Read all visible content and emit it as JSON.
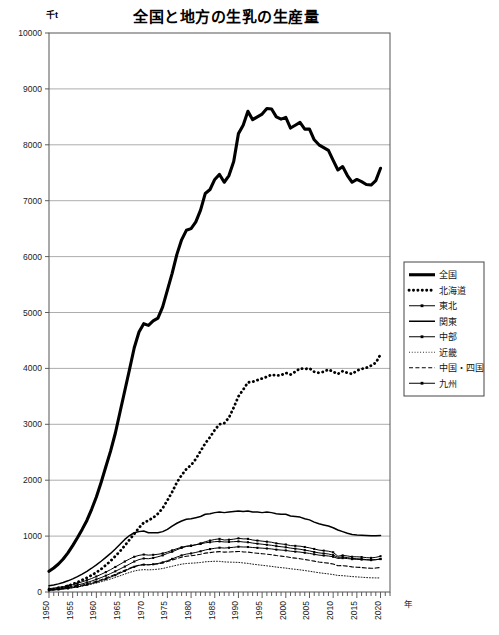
{
  "chart_data": {
    "type": "line",
    "title": "全国と地方の生乳の生産量",
    "unit_label": "千t",
    "xlabel": "年",
    "ylabel": "",
    "xlim": [
      1950,
      2022
    ],
    "ylim": [
      0,
      10000
    ],
    "ytick_step": 1000,
    "yticks": [
      "0",
      "1000",
      "2000",
      "3000",
      "4000",
      "5000",
      "6000",
      "7000",
      "8000",
      "9000",
      "10000"
    ],
    "xticks": [
      "1950",
      "1955",
      "1960",
      "1965",
      "1970",
      "1975",
      "1980",
      "1985",
      "1990",
      "1995",
      "2000",
      "2005",
      "2010",
      "2015",
      "2020"
    ],
    "xtick_step": 5,
    "xminor_step": 1,
    "grid": "horizontal",
    "legend_position": "right-middle",
    "x": [
      1950,
      1951,
      1952,
      1953,
      1954,
      1955,
      1956,
      1957,
      1958,
      1959,
      1960,
      1961,
      1962,
      1963,
      1964,
      1965,
      1966,
      1967,
      1968,
      1969,
      1970,
      1971,
      1972,
      1973,
      1974,
      1975,
      1976,
      1977,
      1978,
      1979,
      1980,
      1981,
      1982,
      1983,
      1984,
      1985,
      1986,
      1987,
      1988,
      1989,
      1990,
      1991,
      1992,
      1993,
      1994,
      1995,
      1996,
      1997,
      1998,
      1999,
      2000,
      2001,
      2002,
      2003,
      2004,
      2005,
      2006,
      2007,
      2008,
      2009,
      2010,
      2011,
      2012,
      2013,
      2014,
      2015,
      2016,
      2017,
      2018,
      2019,
      2020
    ],
    "series": [
      {
        "name": "全国",
        "style": "thick-solid",
        "values": [
          370,
          430,
          500,
          590,
          700,
          830,
          970,
          1120,
          1280,
          1480,
          1700,
          1960,
          2240,
          2520,
          2840,
          3220,
          3600,
          3980,
          4370,
          4650,
          4800,
          4770,
          4850,
          4900,
          5100,
          5400,
          5700,
          6040,
          6300,
          6470,
          6500,
          6620,
          6830,
          7130,
          7200,
          7380,
          7470,
          7330,
          7450,
          7700,
          8200,
          8350,
          8600,
          8450,
          8500,
          8550,
          8650,
          8640,
          8500,
          8460,
          8490,
          8300,
          8350,
          8400,
          8280,
          8280,
          8090,
          8000,
          7950,
          7900,
          7720,
          7550,
          7610,
          7450,
          7330,
          7380,
          7340,
          7290,
          7280,
          7360,
          7580
        ]
      },
      {
        "name": "北海道",
        "style": "thick-dotted",
        "values": [
          40,
          50,
          65,
          85,
          110,
          140,
          175,
          215,
          255,
          300,
          350,
          410,
          480,
          555,
          640,
          730,
          830,
          935,
          1040,
          1150,
          1240,
          1280,
          1330,
          1400,
          1500,
          1640,
          1790,
          1960,
          2090,
          2200,
          2270,
          2380,
          2520,
          2660,
          2770,
          2900,
          3000,
          3020,
          3120,
          3300,
          3500,
          3620,
          3750,
          3760,
          3790,
          3820,
          3850,
          3890,
          3870,
          3880,
          3920,
          3890,
          3940,
          4000,
          3990,
          4000,
          3940,
          3920,
          3940,
          3980,
          3940,
          3900,
          3950,
          3920,
          3900,
          3960,
          3990,
          4010,
          4050,
          4100,
          4250
        ]
      },
      {
        "name": "東北",
        "style": "marker-line",
        "values": [
          45,
          52,
          62,
          74,
          88,
          104,
          124,
          146,
          170,
          196,
          226,
          258,
          292,
          330,
          370,
          412,
          455,
          500,
          545,
          580,
          600,
          595,
          610,
          630,
          655,
          690,
          720,
          755,
          790,
          815,
          825,
          845,
          870,
          900,
          920,
          940,
          950,
          930,
          935,
          945,
          960,
          950,
          950,
          930,
          920,
          910,
          900,
          890,
          870,
          860,
          850,
          830,
          825,
          820,
          805,
          790,
          770,
          750,
          740,
          730,
          710,
          640,
          655,
          645,
          630,
          630,
          625,
          615,
          610,
          620,
          640
        ]
      },
      {
        "name": "関東",
        "style": "solid",
        "values": [
          110,
          125,
          145,
          170,
          200,
          235,
          275,
          320,
          370,
          425,
          485,
          550,
          620,
          690,
          770,
          855,
          940,
          1010,
          1060,
          1080,
          1090,
          1060,
          1060,
          1060,
          1080,
          1120,
          1180,
          1230,
          1270,
          1300,
          1310,
          1330,
          1350,
          1390,
          1400,
          1420,
          1430,
          1420,
          1430,
          1440,
          1450,
          1440,
          1450,
          1430,
          1430,
          1420,
          1430,
          1420,
          1400,
          1390,
          1390,
          1360,
          1350,
          1340,
          1310,
          1290,
          1250,
          1220,
          1200,
          1180,
          1150,
          1110,
          1080,
          1050,
          1030,
          1020,
          1015,
          1010,
          1005,
          1005,
          1010
        ]
      },
      {
        "name": "中部",
        "style": "marker-line",
        "values": [
          60,
          70,
          82,
          96,
          113,
          133,
          156,
          182,
          210,
          242,
          278,
          316,
          356,
          400,
          448,
          496,
          545,
          590,
          630,
          655,
          670,
          660,
          665,
          675,
          690,
          715,
          745,
          775,
          800,
          820,
          830,
          845,
          860,
          880,
          890,
          900,
          905,
          895,
          895,
          900,
          905,
          895,
          890,
          875,
          865,
          855,
          845,
          835,
          820,
          810,
          800,
          785,
          775,
          765,
          750,
          735,
          715,
          700,
          690,
          680,
          660,
          620,
          625,
          615,
          600,
          595,
          590,
          580,
          575,
          580,
          590
        ]
      },
      {
        "name": "近畿",
        "style": "fine-dotted",
        "values": [
          35,
          40,
          47,
          55,
          65,
          77,
          90,
          105,
          122,
          140,
          161,
          183,
          207,
          233,
          260,
          290,
          320,
          350,
          375,
          392,
          400,
          396,
          400,
          408,
          420,
          440,
          460,
          480,
          498,
          510,
          515,
          520,
          528,
          540,
          545,
          550,
          548,
          538,
          535,
          532,
          530,
          520,
          512,
          498,
          488,
          478,
          468,
          458,
          446,
          436,
          428,
          415,
          406,
          396,
          384,
          372,
          358,
          344,
          334,
          324,
          312,
          296,
          292,
          284,
          276,
          270,
          264,
          258,
          254,
          252,
          252
        ]
      },
      {
        "name": "中国・四国",
        "style": "dashed",
        "values": [
          38,
          45,
          54,
          64,
          76,
          90,
          107,
          125,
          146,
          168,
          194,
          221,
          250,
          282,
          316,
          352,
          388,
          424,
          458,
          480,
          492,
          487,
          494,
          504,
          520,
          545,
          572,
          598,
          622,
          640,
          648,
          660,
          675,
          695,
          705,
          716,
          722,
          714,
          716,
          720,
          725,
          718,
          714,
          702,
          694,
          685,
          676,
          666,
          652,
          642,
          632,
          616,
          606,
          596,
          582,
          568,
          552,
          536,
          526,
          516,
          500,
          470,
          472,
          462,
          450,
          444,
          438,
          430,
          425,
          428,
          440
        ]
      },
      {
        "name": "九州",
        "style": "marker-line",
        "values": [
          30,
          36,
          44,
          53,
          64,
          77,
          92,
          110,
          130,
          152,
          178,
          205,
          234,
          266,
          300,
          338,
          376,
          414,
          450,
          476,
          490,
          486,
          496,
          510,
          530,
          560,
          592,
          625,
          655,
          678,
          690,
          708,
          728,
          752,
          768,
          782,
          792,
          786,
          792,
          800,
          810,
          805,
          805,
          796,
          790,
          784,
          778,
          770,
          758,
          750,
          744,
          730,
          722,
          714,
          702,
          690,
          674,
          660,
          652,
          644,
          630,
          600,
          606,
          598,
          588,
          584,
          580,
          574,
          570,
          576,
          590
        ]
      }
    ]
  }
}
